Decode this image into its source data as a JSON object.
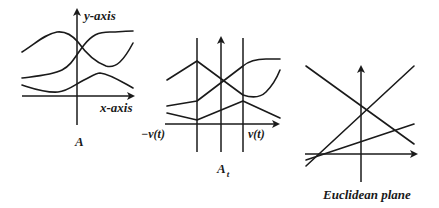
{
  "figure": {
    "panels": [
      {
        "id": "A",
        "caption": "A",
        "y_axis_label": "y-axis",
        "x_axis_label": "x-axis",
        "curve_count": 4
      },
      {
        "id": "At",
        "caption_main": "A",
        "caption_sub": "t",
        "left_boundary_label": "−v(t)",
        "right_boundary_label": "v(t)",
        "curve_count": 4
      },
      {
        "id": "euclidean",
        "caption": "Euclidean plane",
        "line_count": 3
      }
    ]
  }
}
